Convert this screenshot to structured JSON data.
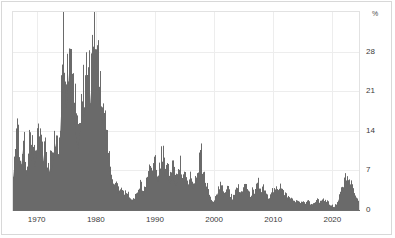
{
  "chart_data": {
    "type": "bar",
    "title": "",
    "subtitle": "",
    "xlabel": "",
    "ylabel": "",
    "unit_label": "%",
    "grid": true,
    "legend": "none",
    "xlim": [
      1966.0,
      2024.5
    ],
    "ylim": [
      0,
      35
    ],
    "yticks": [
      0,
      7,
      14,
      21,
      28
    ],
    "ytick_labels": [
      "0",
      "7",
      "14",
      "21",
      "28"
    ],
    "xticks": [
      1970,
      1980,
      1990,
      2000,
      2010,
      2020
    ],
    "xtick_labels": [
      "1970",
      "1980",
      "1990",
      "2000",
      "2010",
      "2020"
    ],
    "series_name": "rate",
    "series_color": "#6a6a6a",
    "x": [
      1966.0,
      1966.25,
      1966.5,
      1966.75,
      1967.0,
      1967.25,
      1967.5,
      1967.75,
      1968.0,
      1968.25,
      1968.5,
      1968.75,
      1969.0,
      1969.25,
      1969.5,
      1969.75,
      1970.0,
      1970.25,
      1970.5,
      1970.75,
      1971.0,
      1971.25,
      1971.5,
      1971.75,
      1972.0,
      1972.25,
      1972.5,
      1972.75,
      1973.0,
      1973.25,
      1973.5,
      1973.75,
      1974.0,
      1974.25,
      1974.5,
      1974.75,
      1975.0,
      1975.25,
      1975.5,
      1975.75,
      1976.0,
      1976.25,
      1976.5,
      1976.75,
      1977.0,
      1977.25,
      1977.5,
      1977.75,
      1978.0,
      1978.25,
      1978.5,
      1978.75,
      1979.0,
      1979.25,
      1979.5,
      1979.75,
      1980.0,
      1980.25,
      1980.5,
      1980.75,
      1981.0,
      1981.25,
      1981.5,
      1981.75,
      1982.0,
      1982.25,
      1982.5,
      1982.75,
      1983.0,
      1983.25,
      1983.5,
      1983.75,
      1984.0,
      1984.25,
      1984.5,
      1984.75,
      1985.0,
      1985.25,
      1985.5,
      1985.75,
      1986.0,
      1986.25,
      1986.5,
      1986.75,
      1987.0,
      1987.25,
      1987.5,
      1987.75,
      1988.0,
      1988.25,
      1988.5,
      1988.75,
      1989.0,
      1989.25,
      1989.5,
      1989.75,
      1990.0,
      1990.25,
      1990.5,
      1990.75,
      1991.0,
      1991.25,
      1991.5,
      1991.75,
      1992.0,
      1992.25,
      1992.5,
      1992.75,
      1993.0,
      1993.25,
      1993.5,
      1993.75,
      1994.0,
      1994.25,
      1994.5,
      1994.75,
      1995.0,
      1995.25,
      1995.5,
      1995.75,
      1996.0,
      1996.25,
      1996.5,
      1996.75,
      1997.0,
      1997.25,
      1997.5,
      1997.75,
      1998.0,
      1998.25,
      1998.5,
      1998.75,
      1999.0,
      1999.25,
      1999.5,
      1999.75,
      2000.0,
      2000.25,
      2000.5,
      2000.75,
      2001.0,
      2001.25,
      2001.5,
      2001.75,
      2002.0,
      2002.25,
      2002.5,
      2002.75,
      2003.0,
      2003.25,
      2003.5,
      2003.75,
      2004.0,
      2004.25,
      2004.5,
      2004.75,
      2005.0,
      2005.25,
      2005.5,
      2005.75,
      2006.0,
      2006.25,
      2006.5,
      2006.75,
      2007.0,
      2007.25,
      2007.5,
      2007.75,
      2008.0,
      2008.25,
      2008.5,
      2008.75,
      2009.0,
      2009.25,
      2009.5,
      2009.75,
      2010.0,
      2010.25,
      2010.5,
      2010.75,
      2011.0,
      2011.25,
      2011.5,
      2011.75,
      2012.0,
      2012.25,
      2012.5,
      2012.75,
      2013.0,
      2013.25,
      2013.5,
      2013.75,
      2014.0,
      2014.25,
      2014.5,
      2014.75,
      2015.0,
      2015.25,
      2015.5,
      2015.75,
      2016.0,
      2016.25,
      2016.5,
      2016.75,
      2017.0,
      2017.25,
      2017.5,
      2017.75,
      2018.0,
      2018.25,
      2018.5,
      2018.75,
      2019.0,
      2019.25,
      2019.5,
      2019.75,
      2020.0,
      2020.25,
      2020.5,
      2020.75,
      2021.0,
      2021.25,
      2021.5,
      2021.75,
      2022.0,
      2022.25,
      2022.5,
      2022.75,
      2023.0,
      2023.25,
      2023.5,
      2023.75,
      2024.0,
      2024.25
    ],
    "values": [
      6.5,
      9.8,
      12.0,
      15.2,
      11.0,
      8.4,
      10.5,
      13.8,
      9.2,
      7.0,
      8.8,
      12.0,
      10.0,
      13.0,
      11.5,
      9.0,
      12.5,
      16.0,
      14.0,
      11.0,
      9.5,
      12.0,
      10.0,
      8.0,
      7.5,
      9.0,
      8.0,
      10.5,
      12.0,
      14.5,
      13.0,
      10.0,
      17.0,
      24.0,
      30.5,
      27.0,
      21.0,
      25.0,
      30.0,
      24.0,
      19.0,
      22.0,
      18.0,
      15.0,
      13.0,
      16.0,
      18.5,
      21.0,
      20.0,
      23.0,
      26.0,
      24.0,
      22.0,
      26.5,
      29.0,
      31.0,
      33.5,
      30.0,
      26.0,
      22.0,
      18.0,
      20.0,
      16.5,
      13.0,
      11.0,
      9.0,
      7.5,
      6.0,
      5.0,
      4.5,
      4.0,
      3.5,
      3.8,
      3.2,
      2.8,
      3.0,
      3.5,
      3.0,
      2.5,
      2.2,
      2.0,
      1.8,
      2.2,
      2.5,
      3.0,
      3.5,
      4.5,
      4.0,
      3.0,
      4.0,
      5.0,
      6.0,
      7.5,
      8.8,
      8.0,
      7.2,
      8.5,
      7.0,
      6.0,
      7.5,
      9.0,
      10.0,
      8.5,
      7.0,
      8.0,
      6.5,
      5.5,
      6.5,
      7.5,
      6.0,
      5.0,
      6.0,
      7.0,
      8.0,
      7.0,
      6.0,
      6.5,
      5.5,
      4.8,
      5.5,
      6.0,
      5.0,
      4.5,
      5.0,
      6.0,
      7.0,
      8.5,
      10.0,
      7.0,
      6.0,
      5.0,
      4.0,
      3.0,
      2.2,
      1.5,
      1.2,
      1.8,
      2.5,
      3.2,
      4.0,
      4.5,
      3.8,
      3.0,
      2.5,
      3.0,
      3.8,
      3.2,
      2.5,
      2.0,
      2.5,
      3.0,
      3.5,
      4.0,
      3.5,
      3.0,
      3.5,
      4.0,
      4.5,
      3.8,
      3.0,
      2.5,
      2.8,
      3.5,
      3.0,
      3.5,
      4.2,
      4.8,
      4.0,
      3.5,
      4.5,
      3.8,
      3.0,
      2.2,
      1.8,
      2.5,
      3.0,
      3.5,
      4.2,
      3.5,
      3.0,
      3.5,
      4.0,
      3.2,
      2.6,
      2.8,
      2.2,
      2.0,
      2.4,
      2.0,
      1.8,
      1.5,
      1.6,
      1.8,
      1.5,
      1.2,
      1.4,
      1.2,
      1.0,
      1.2,
      1.5,
      1.3,
      1.0,
      0.9,
      1.1,
      1.5,
      1.8,
      1.6,
      1.4,
      1.8,
      2.0,
      1.7,
      1.5,
      1.6,
      1.3,
      1.0,
      0.8,
      0.6,
      0.5,
      0.8,
      1.2,
      2.0,
      2.8,
      3.5,
      4.2,
      5.0,
      6.0,
      6.5,
      5.5,
      4.8,
      4.0,
      3.2,
      2.6,
      2.0,
      1.6
    ]
  },
  "axes": {
    "yticks": [
      {
        "label": "28",
        "value": 28
      },
      {
        "label": "21",
        "value": 21
      },
      {
        "label": "14",
        "value": 14
      },
      {
        "label": "7",
        "value": 7
      },
      {
        "label": "0",
        "value": 0
      }
    ],
    "xticks": [
      {
        "label": "1970",
        "value": 1970
      },
      {
        "label": "1980",
        "value": 1980
      },
      {
        "label": "1990",
        "value": 1990
      },
      {
        "label": "2000",
        "value": 2000
      },
      {
        "label": "2010",
        "value": 2010
      },
      {
        "label": "2020",
        "value": 2020
      }
    ],
    "unit": "%"
  },
  "colors": {
    "series": "#6a6a6a",
    "grid": "#ededed",
    "axis": "#6d6d6d",
    "frame": "#e2e2e2",
    "outer_frame": "#d8d8d8",
    "text": "#3b3b3b",
    "background": "#ffffff"
  }
}
